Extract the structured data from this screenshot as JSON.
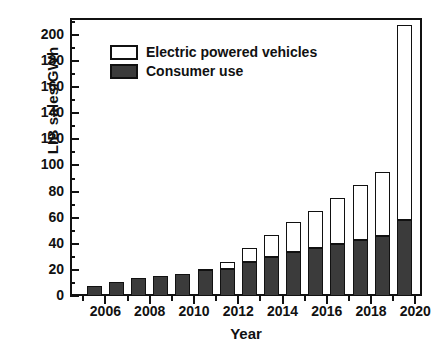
{
  "chart_data": {
    "type": "bar",
    "stacked": true,
    "title": "",
    "xlabel": "Year",
    "ylabel": "LIB sales/GWh",
    "xlim": [
      2004.4,
      2020.3
    ],
    "ylim": [
      0,
      213
    ],
    "ytick_step": 20,
    "yminor_step": 10,
    "xtick_step": 1,
    "xlabel_step": 2,
    "grid": false,
    "legend_position": "upper-left-inside",
    "categories": [
      2005,
      2006,
      2007,
      2008,
      2009,
      2010,
      2011,
      2012,
      2013,
      2014,
      2015,
      2016,
      2017,
      2018,
      2019
    ],
    "xtick_labels": [
      "2006",
      "2008",
      "2010",
      "2012",
      "2014",
      "2016",
      "2018",
      "2020"
    ],
    "xtick_label_values": [
      2006,
      2008,
      2010,
      2012,
      2014,
      2016,
      2018,
      2020
    ],
    "ytick_labels": [
      "0",
      "20",
      "40",
      "60",
      "80",
      "100",
      "120",
      "140",
      "160",
      "180",
      "200"
    ],
    "ytick_values": [
      0,
      20,
      40,
      60,
      80,
      100,
      120,
      140,
      160,
      180,
      200
    ],
    "series": [
      {
        "name": "Consumer use",
        "color": "#3b3b3b",
        "values": [
          8,
          11,
          14,
          15,
          17,
          20,
          21,
          26,
          30,
          34,
          37,
          40,
          43,
          46,
          58
        ]
      },
      {
        "name": "Electric powered vehicles",
        "color": "#ffffff",
        "values": [
          0,
          0,
          0,
          0,
          0,
          0.5,
          5,
          11,
          17,
          23,
          28,
          35,
          42,
          49,
          150
        ]
      }
    ],
    "totals": [
      8,
      11,
      14,
      15,
      17,
      20.5,
      26,
      37,
      47,
      57,
      65,
      75,
      85,
      95,
      208
    ]
  },
  "legend": {
    "items": [
      {
        "label": "Electric powered vehicles",
        "swatch": "open-square"
      },
      {
        "label": "Consumer use",
        "swatch": "filled-square"
      }
    ]
  },
  "axes": {
    "x_title": "Year",
    "y_title": "LIB sales/GWh"
  }
}
